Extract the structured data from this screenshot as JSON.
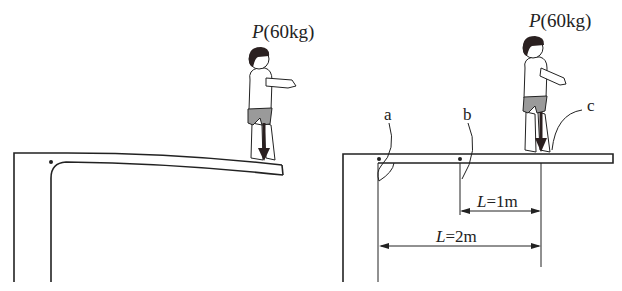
{
  "diagram": {
    "left_panel": {
      "person_label": {
        "symbol": "P",
        "mass": "(60kg)"
      },
      "description": "Diving board bending downward under person at free end"
    },
    "right_panel": {
      "person_label": {
        "symbol": "P",
        "mass": "(60kg)"
      },
      "points": [
        {
          "id": "a",
          "label": "a"
        },
        {
          "id": "b",
          "label": "b"
        },
        {
          "id": "c",
          "label": "c"
        }
      ],
      "dimensions": [
        {
          "symbol": "L",
          "value": "=1m"
        },
        {
          "symbol": "L",
          "value": "=2m"
        }
      ]
    },
    "colors": {
      "line": "#222222",
      "shorts": "#9a9a9a",
      "hair": "#2a2020",
      "arrow": "#2a1f1f"
    }
  }
}
